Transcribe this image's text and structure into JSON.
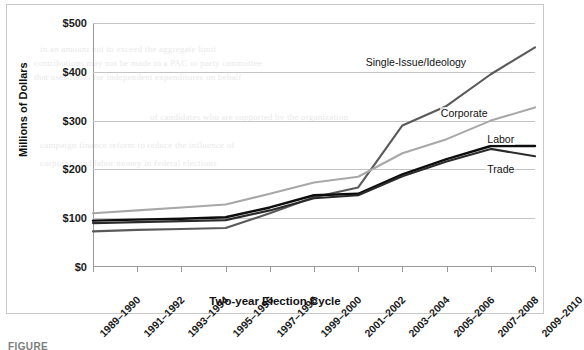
{
  "figure": {
    "caption": "FIGURE"
  },
  "chart_data": {
    "type": "line",
    "title": "",
    "xlabel": "Two-year Election Cycle",
    "ylabel": "Millions of Dollars",
    "ylim": [
      0,
      500
    ],
    "ytick_values": [
      0,
      100,
      200,
      300,
      400,
      500
    ],
    "ytick_labels": [
      "$0",
      "$100",
      "$200",
      "$300",
      "$400",
      "$500"
    ],
    "grid": true,
    "legend_position": "inline-right-of-line-ends",
    "categories": [
      "1989–1990",
      "1991–1992",
      "1993–1994",
      "1995–1996",
      "1997–1998",
      "1999–2000",
      "2001–2002",
      "2003–2004",
      "2005–2006",
      "2007–2008",
      "2009–2010"
    ],
    "series": [
      {
        "name": "Single-Issue/Ideology",
        "color": "#5a5a5a",
        "width": 2.1,
        "values": [
          73,
          76,
          78,
          80,
          110,
          143,
          163,
          290,
          330,
          395,
          450
        ]
      },
      {
        "name": "Corporate",
        "color": "#a8a8a8",
        "width": 2.1,
        "values": [
          110,
          116,
          122,
          128,
          150,
          173,
          185,
          233,
          262,
          300,
          327
        ]
      },
      {
        "name": "Labor",
        "color": "#0d0d0d",
        "width": 2.4,
        "values": [
          95,
          97,
          99,
          102,
          122,
          147,
          150,
          190,
          221,
          248,
          248
        ]
      },
      {
        "name": "Trade",
        "color": "#2b2b2b",
        "width": 2.1,
        "values": [
          90,
          92,
          94,
          96,
          116,
          141,
          147,
          186,
          216,
          242,
          227
        ]
      }
    ]
  },
  "bleed_text": {
    "lines": [
      "in an amount not to exceed the aggregate limit",
      "contributions may not be made to a PAC or party committee",
      "that uses funds for independent expenditures on behalf",
      "of candidates who are supported by the organization",
      "campaign finance reform to reduce the influence of",
      "corporate and labor money in federal elections"
    ]
  }
}
